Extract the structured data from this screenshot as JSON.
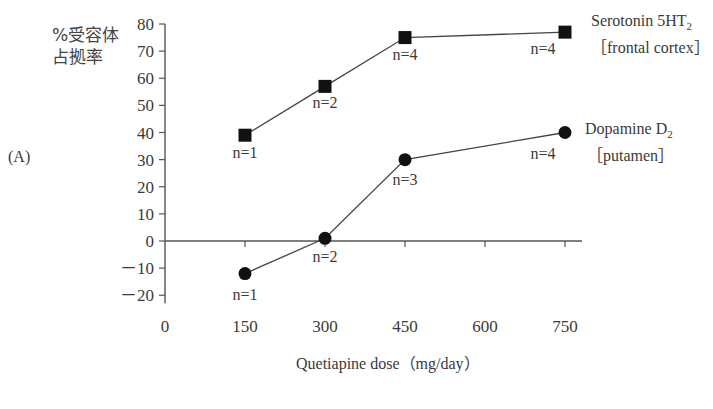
{
  "panel_label": "(A)",
  "ylabel_line1": "%受容体",
  "ylabel_line2": "占拠率",
  "xlabel": "Quetiapine dose（mg/day）",
  "legend": {
    "serotonin_line1": "Serotonin 5HT",
    "serotonin_sub": "2",
    "serotonin_line2": "［frontal cortex］",
    "dopamine_line1": "Dopamine D",
    "dopamine_sub": "2",
    "dopamine_line2": "［putamen］"
  },
  "chart_data": {
    "type": "line",
    "title": "",
    "panel": "(A)",
    "xlabel": "Quetiapine dose（mg/day）",
    "ylabel": "%受容体占拠率",
    "x_ticks": [
      0,
      150,
      300,
      450,
      600,
      750
    ],
    "y_ticks": [
      -20,
      -10,
      0,
      10,
      20,
      30,
      40,
      50,
      60,
      70,
      80
    ],
    "xlim": [
      0,
      750
    ],
    "ylim": [
      -20,
      80
    ],
    "grid": false,
    "legend_position": "right, inline labels",
    "series": [
      {
        "name": "Serotonin 5HT2 [frontal cortex]",
        "marker": "square",
        "x": [
          150,
          300,
          450,
          750
        ],
        "values": [
          39,
          57,
          75,
          77
        ],
        "n_labels": [
          "n=1",
          "n=2",
          "n=4",
          "n=4"
        ]
      },
      {
        "name": "Dopamine D2 [putamen]",
        "marker": "circle",
        "x": [
          150,
          300,
          450,
          750
        ],
        "values": [
          -12,
          1,
          30,
          40
        ],
        "n_labels": [
          "n=1",
          "n=2",
          "n=3",
          "n=4"
        ]
      }
    ]
  }
}
